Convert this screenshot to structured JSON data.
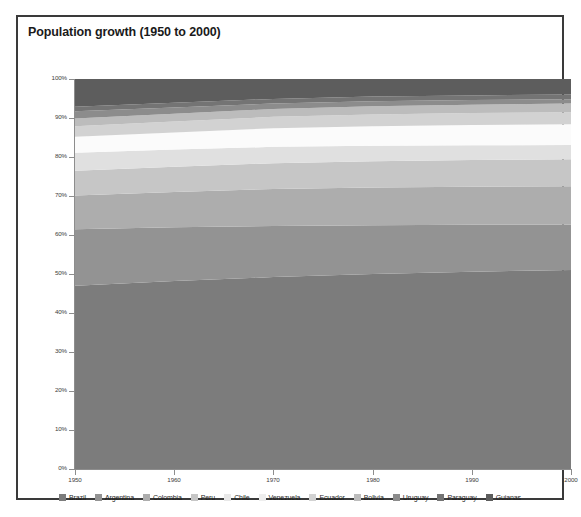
{
  "chart": {
    "title": "Population growth (1950 to 2000)"
  },
  "chart_data": {
    "type": "area",
    "title": "Population growth (1950 to 2000)",
    "subtitle": "",
    "xlabel": "",
    "ylabel": "",
    "stacked": true,
    "normalized": true,
    "grid": false,
    "legend_position": "bottom",
    "xlim": [
      1950,
      2000
    ],
    "ylim": [
      0,
      100
    ],
    "x": [
      1950,
      1960,
      1970,
      1980,
      1990,
      2000
    ],
    "xtick_labels": [
      "1950",
      "1960",
      "1970",
      "1980",
      "1990",
      "2000"
    ],
    "ytick_values": [
      0,
      10,
      20,
      30,
      40,
      50,
      60,
      70,
      80,
      90,
      100
    ],
    "ytick_labels": [
      "0%",
      "10%",
      "20%",
      "30%",
      "40%",
      "50%",
      "60%",
      "70%",
      "80%",
      "90%",
      "100%"
    ],
    "series": [
      {
        "name": "Brazil",
        "color": "#7c7c7c",
        "values": [
          47.0,
          48.2,
          49.2,
          50.0,
          50.6,
          51.0
        ]
      },
      {
        "name": "Argentina",
        "color": "#939393",
        "values": [
          14.5,
          13.8,
          13.1,
          12.5,
          12.0,
          11.6
        ]
      },
      {
        "name": "Colombia",
        "color": "#adadad",
        "values": [
          8.6,
          9.0,
          9.5,
          9.7,
          9.8,
          9.9
        ]
      },
      {
        "name": "Peru",
        "color": "#c6c6c6",
        "values": [
          6.4,
          6.5,
          6.6,
          6.7,
          6.8,
          6.9
        ]
      },
      {
        "name": "Chile",
        "color": "#e0e0e0",
        "values": [
          4.6,
          4.4,
          4.2,
          4.0,
          3.8,
          3.7
        ]
      },
      {
        "name": "Venezuela",
        "color": "#fbfbfb",
        "values": [
          4.1,
          4.4,
          4.8,
          5.0,
          5.2,
          5.3
        ]
      },
      {
        "name": "Ecuador",
        "color": "#d2d2d2",
        "values": [
          2.7,
          2.8,
          2.9,
          3.0,
          3.1,
          3.1
        ]
      },
      {
        "name": "Bolivia",
        "color": "#bcbcbc",
        "values": [
          2.0,
          2.0,
          2.0,
          2.1,
          2.1,
          2.2
        ]
      },
      {
        "name": "Uruguay",
        "color": "#8c8c8c",
        "values": [
          1.8,
          1.6,
          1.4,
          1.3,
          1.2,
          1.1
        ]
      },
      {
        "name": "Paraguay",
        "color": "#747474",
        "values": [
          1.2,
          1.2,
          1.2,
          1.2,
          1.2,
          1.2
        ]
      },
      {
        "name": "Guianas",
        "color": "#5d5d5d",
        "values": [
          7.1,
          6.1,
          5.1,
          4.5,
          4.2,
          4.0
        ]
      }
    ]
  },
  "legend": {
    "items": [
      {
        "label": "Brazil",
        "color": "#7c7c7c"
      },
      {
        "label": "Argentina",
        "color": "#939393"
      },
      {
        "label": "Colombia",
        "color": "#adadad"
      },
      {
        "label": "Peru",
        "color": "#c6c6c6"
      },
      {
        "label": "Chile",
        "color": "#e8e8e8"
      },
      {
        "label": "Venezuela",
        "color": "#eeeeee"
      },
      {
        "label": "Ecuador",
        "color": "#d2d2d2"
      },
      {
        "label": "Bolivia",
        "color": "#bcbcbc"
      },
      {
        "label": "Uruguay",
        "color": "#8c8c8c"
      },
      {
        "label": "Paraguay",
        "color": "#747474"
      },
      {
        "label": "Guianas",
        "color": "#5d5d5d"
      }
    ]
  },
  "colors": {
    "frame": "#3a3a3a",
    "axis": "#8d8d8d",
    "text": "#1a1a1a",
    "background": "#ffffff"
  }
}
